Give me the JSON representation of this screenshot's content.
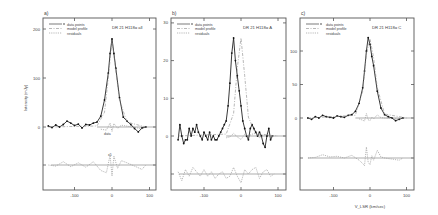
{
  "figure": {
    "xlabel": "V_LSR (km/sec)",
    "ylabel": "Intensity (mJy)"
  },
  "legend": {
    "data": "data points",
    "model": "model profile",
    "residuals": "residuals"
  },
  "chart_data": [
    {
      "type": "line",
      "panel": "a)",
      "title": "DR 21   H118α  all",
      "xlabel": "",
      "ylabel": "Intensity (mJy)",
      "xlim": [
        -180,
        100
      ],
      "ylim": [
        -80,
        225
      ],
      "xticks": [
        -100,
        0,
        100
      ],
      "yticks": [
        0,
        100,
        200
      ],
      "annotations": [
        "data",
        "x5"
      ],
      "series": [
        {
          "name": "data points",
          "x": [
            -170,
            -160,
            -150,
            -140,
            -130,
            -120,
            -110,
            -100,
            -90,
            -80,
            -70,
            -60,
            -50,
            -40,
            -30,
            -20,
            -10,
            -5,
            0,
            5,
            10,
            20,
            30,
            40,
            50,
            60,
            70,
            80,
            90
          ],
          "values": [
            2,
            -1,
            4,
            0,
            5,
            12,
            8,
            3,
            6,
            -2,
            5,
            4,
            8,
            10,
            22,
            55,
            110,
            150,
            180,
            150,
            120,
            60,
            20,
            12,
            5,
            -3,
            -10,
            -2,
            0
          ]
        },
        {
          "name": "model profile",
          "x": [
            -170,
            -40,
            -20,
            -10,
            0,
            10,
            20,
            40,
            90
          ],
          "values": [
            0,
            2,
            30,
            100,
            178,
            115,
            55,
            10,
            0
          ]
        },
        {
          "name": "residuals",
          "x": [
            -170,
            -150,
            -130,
            -110,
            -90,
            -70,
            -50,
            -30,
            -15,
            -5,
            0,
            5,
            15,
            25,
            40,
            60,
            80,
            90
          ],
          "values": [
            0,
            -2,
            6,
            -3,
            4,
            -4,
            6,
            -10,
            -14,
            18,
            -20,
            16,
            -6,
            8,
            4,
            -2,
            -8,
            0
          ]
        }
      ]
    },
    {
      "type": "line",
      "panel": "b)",
      "title": "DR 21   H118α  A",
      "xlabel": "",
      "ylabel": "",
      "xlim": [
        -180,
        110
      ],
      "ylim": [
        -16,
        32
      ],
      "xticks": [
        -100,
        0,
        100
      ],
      "yticks": [
        0,
        10,
        20,
        30
      ],
      "series": [
        {
          "name": "data points",
          "x": [
            -170,
            -165,
            -160,
            -155,
            -150,
            -145,
            -140,
            -135,
            -130,
            -125,
            -120,
            -115,
            -110,
            -105,
            -100,
            -95,
            -90,
            -85,
            -80,
            -75,
            -70,
            -65,
            -60,
            -55,
            -50,
            -45,
            -40,
            -35,
            -30,
            -25,
            -20,
            -15,
            -10,
            -5,
            0,
            5,
            10,
            15,
            20,
            25,
            30,
            35,
            40,
            45,
            50,
            55,
            60,
            65,
            70,
            75,
            80,
            85
          ],
          "values": [
            -1,
            3,
            0,
            -2,
            -1,
            -1,
            2,
            0,
            2,
            1,
            3,
            1,
            0,
            -1,
            1,
            0,
            -1,
            1,
            -1,
            0,
            -1,
            -1,
            0,
            1,
            2,
            3,
            4,
            8,
            14,
            22,
            26,
            20,
            16,
            12,
            8,
            4,
            2,
            0,
            -1,
            2,
            3,
            2,
            1,
            0,
            1,
            0,
            -2,
            -3,
            0,
            2,
            -1,
            0
          ],
          "note": "x offset (peak near 0)"
        },
        {
          "name": "model profile",
          "x": [
            -170,
            -40,
            -20,
            -10,
            0,
            10,
            20,
            40,
            100
          ],
          "values": [
            0,
            0.5,
            6,
            18,
            26,
            16,
            5,
            0.5,
            0
          ]
        },
        {
          "name": "residuals",
          "x": [
            -170,
            -160,
            -150,
            -140,
            -130,
            -120,
            -110,
            -100,
            -90,
            -80,
            -70,
            -60,
            -50,
            -40,
            -30,
            -20,
            -10,
            0,
            10,
            20,
            30,
            40,
            50,
            60,
            70,
            80,
            90
          ],
          "values": [
            1,
            -3,
            2,
            -1,
            3,
            1,
            -1,
            2,
            -1,
            1,
            -2,
            0,
            1,
            -2,
            -1,
            3,
            -1,
            -4,
            2,
            0,
            2,
            3,
            -2,
            1,
            2,
            -1,
            0
          ]
        }
      ]
    },
    {
      "type": "line",
      "panel": "c)",
      "title": "DR 21   H118α  C",
      "xlabel": "V_LSR (km/sec)",
      "ylabel": "",
      "xlim": [
        -180,
        110
      ],
      "ylim": [
        -60,
        135
      ],
      "xticks": [
        -100,
        0,
        100
      ],
      "yticks": [
        0,
        50,
        100
      ],
      "series": [
        {
          "name": "data points",
          "x": [
            -170,
            -160,
            -150,
            -140,
            -130,
            -120,
            -110,
            -100,
            -90,
            -80,
            -70,
            -60,
            -50,
            -40,
            -30,
            -20,
            -15,
            -10,
            -5,
            0,
            5,
            10,
            20,
            30,
            40,
            50,
            60,
            70,
            80,
            90
          ],
          "values": [
            0,
            -2,
            2,
            0,
            4,
            2,
            1,
            0,
            3,
            2,
            1,
            4,
            5,
            10,
            22,
            45,
            70,
            100,
            120,
            110,
            92,
            78,
            40,
            15,
            5,
            2,
            0,
            -4,
            -2,
            0
          ]
        },
        {
          "name": "model profile",
          "x": [
            -170,
            -40,
            -20,
            -10,
            0,
            10,
            20,
            40,
            100
          ],
          "values": [
            0,
            4,
            40,
            95,
            118,
            90,
            45,
            6,
            0
          ]
        },
        {
          "name": "residuals",
          "x": [
            -170,
            -150,
            -130,
            -110,
            -90,
            -70,
            -50,
            -30,
            -20,
            -15,
            -10,
            -5,
            0,
            5,
            10,
            20,
            30,
            40,
            60,
            80,
            90
          ],
          "values": [
            0,
            1,
            6,
            2,
            3,
            0,
            5,
            -4,
            -10,
            -14,
            20,
            -8,
            -12,
            4,
            -4,
            14,
            2,
            0,
            -2,
            -4,
            0
          ]
        }
      ]
    }
  ]
}
